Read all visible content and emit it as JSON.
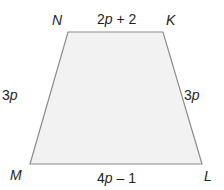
{
  "diagram": {
    "type": "trapezoid",
    "fill_color": "#f2f2f2",
    "stroke_color": "#8c8c8c",
    "text_color": "#231f20",
    "vertices": [
      {
        "name": "N",
        "x": 68,
        "y": 32
      },
      {
        "name": "K",
        "x": 163,
        "y": 32
      },
      {
        "name": "L",
        "x": 202,
        "y": 164
      },
      {
        "name": "M",
        "x": 30,
        "y": 164
      }
    ],
    "labels": {
      "vertex_n": "N",
      "vertex_k": "K",
      "vertex_l": "L",
      "vertex_m": "M",
      "side_nk": {
        "coef": "2",
        "var": "p",
        "rest": " + 2"
      },
      "side_nm": {
        "coef": "3",
        "var": "p"
      },
      "side_kl": {
        "coef": "3",
        "var": "p"
      },
      "side_ml": {
        "coef": "4",
        "var": "p",
        "rest": " – 1"
      }
    }
  }
}
